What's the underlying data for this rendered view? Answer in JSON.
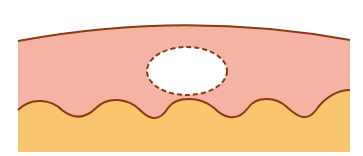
{
  "diagram": {
    "type": "cross-section illustration",
    "colors": {
      "background": "#ffffff",
      "upper_layer": "#f5b3a3",
      "lower_layer": "#f9c56f",
      "outline": "#8a3a14",
      "cavity_fill": "#ffffff",
      "cavity_stroke": "#8a3a14"
    },
    "layers": [
      {
        "name": "upper-layer",
        "fill": "#f5b3a3"
      },
      {
        "name": "lower-layer",
        "fill": "#f9c56f"
      }
    ],
    "cavity": {
      "shape": "ellipse",
      "cx": 187,
      "cy": 71,
      "rx": 40,
      "ry": 24,
      "border": "dashed"
    }
  }
}
